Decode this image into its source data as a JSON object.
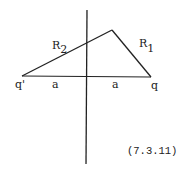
{
  "diagram": {
    "labels": {
      "R2": {
        "main": "R",
        "sub": "2"
      },
      "R1": {
        "main": "R",
        "sub": "1"
      },
      "q_prime": "q'",
      "q": "q",
      "a_left": "a",
      "a_right": "a"
    },
    "equation_number": "(7.3.11)",
    "colors": {
      "line": "#222222",
      "background": "#ffffff"
    }
  }
}
